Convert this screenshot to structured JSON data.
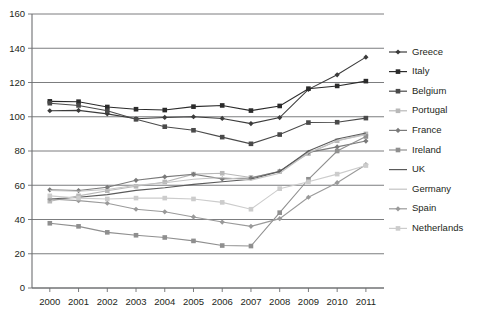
{
  "chart_data": {
    "type": "line",
    "title": "",
    "xlabel": "",
    "ylabel": "",
    "x": [
      2000,
      2001,
      2002,
      2003,
      2004,
      2005,
      2006,
      2007,
      2008,
      2009,
      2010,
      2011
    ],
    "xtick_labels": [
      "2000",
      "2001",
      "2002",
      "2003",
      "2004",
      "2005",
      "2006",
      "2007",
      "2008",
      "2009",
      "2010",
      "2011"
    ],
    "ytick_labels": [
      "0",
      "20",
      "40",
      "60",
      "80",
      "100",
      "120",
      "140",
      "160"
    ],
    "yticks": [
      0,
      20,
      40,
      60,
      80,
      100,
      120,
      140,
      160
    ],
    "ylim": [
      0,
      160
    ],
    "grid": true,
    "legend_position": "right",
    "series": [
      {
        "name": "Greece",
        "marker": "diamond",
        "color": "#3b3b3b",
        "values": [
          103.5,
          103.7,
          101.7,
          97.4,
          98.6,
          100.0,
          106.1,
          107.4,
          112.9,
          129.7,
          148.3,
          170.3
        ],
        "display_values": [
          103.5,
          103.7,
          101.7,
          98.8,
          99.6,
          100.0,
          99.0,
          96.0,
          99.5,
          116.0,
          124.5,
          134.8
        ]
      },
      {
        "name": "Italy",
        "marker": "square",
        "color": "#2b2b2b",
        "values": [
          109.0,
          108.8,
          105.7,
          104.4,
          103.9,
          105.9,
          106.6,
          103.6,
          106.3,
          116.4,
          119.3,
          120.8
        ],
        "display_values": [
          109.0,
          108.8,
          105.7,
          104.4,
          103.9,
          105.9,
          106.6,
          103.6,
          106.3,
          116.4,
          118.0,
          120.8
        ]
      },
      {
        "name": "Belgium",
        "marker": "square",
        "color": "#4a4a4a",
        "values": [
          107.9,
          106.6,
          103.5,
          98.5,
          94.2,
          92.1,
          88.1,
          84.2,
          89.6,
          96.6,
          96.8,
          99.2
        ],
        "display_values": [
          107.9,
          106.6,
          103.5,
          98.5,
          94.2,
          92.1,
          88.1,
          84.2,
          89.6,
          96.6,
          96.8,
          99.2
        ]
      },
      {
        "name": "Portugal",
        "marker": "square",
        "color": "#b8b8b8",
        "values": [
          50.7,
          53.8,
          56.8,
          59.4,
          61.9,
          67.7,
          69.4,
          68.4,
          71.7,
          83.7,
          94.0,
          108.0
        ],
        "display_values": [
          50.7,
          53.8,
          56.8,
          59.4,
          61.9,
          66.5,
          67.0,
          64.5,
          68.0,
          78.5,
          86.0,
          90.0
        ]
      },
      {
        "name": "France",
        "marker": "diamond",
        "color": "#7a7a7a",
        "values": [
          57.3,
          56.9,
          58.8,
          62.9,
          64.9,
          66.4,
          63.7,
          64.2,
          68.2,
          79.2,
          82.4,
          85.8
        ],
        "display_values": [
          57.3,
          56.9,
          58.8,
          62.9,
          64.9,
          66.4,
          63.7,
          64.2,
          68.2,
          79.2,
          82.4,
          85.8
        ]
      },
      {
        "name": "Ireland",
        "marker": "square",
        "color": "#8f8f8f",
        "values": [
          37.0,
          35.2,
          31.9,
          30.7,
          29.4,
          27.2,
          24.5,
          24.8,
          44.2,
          64.4,
          91.2,
          104.1
        ],
        "display_values": [
          37.8,
          36.0,
          32.5,
          30.8,
          29.5,
          27.5,
          24.8,
          24.5,
          44.0,
          63.5,
          80.0,
          88.5
        ]
      },
      {
        "name": "UK",
        "marker": "none",
        "color": "#5a5a5a",
        "values": [
          40.6,
          37.2,
          37.0,
          38.5,
          40.2,
          41.5,
          42.4,
          43.5,
          51.9,
          67.1,
          78.4,
          84.3
        ],
        "display_values": [
          52.0,
          53.0,
          54.5,
          57.0,
          58.5,
          60.5,
          62.0,
          63.5,
          68.0,
          80.0,
          87.0,
          90.5
        ]
      },
      {
        "name": "Germany",
        "marker": "none",
        "color": "#c4c4c4",
        "values": [
          58.9,
          57.7,
          59.4,
          63.1,
          64.8,
          67.0,
          66.5,
          63.7,
          65.2,
          72.6,
          81.0,
          78.4
        ],
        "display_values": [
          57.0,
          56.5,
          57.5,
          60.0,
          61.5,
          63.5,
          64.5,
          63.0,
          67.0,
          79.0,
          86.0,
          89.5
        ]
      },
      {
        "name": "Spain",
        "marker": "diamond",
        "color": "#9a9a9a",
        "values": [
          58.0,
          54.2,
          51.3,
          47.6,
          45.3,
          42.3,
          38.9,
          35.5,
          39.4,
          52.7,
          60.1,
          69.5
        ],
        "display_values": [
          52.0,
          51.0,
          49.5,
          46.0,
          44.5,
          41.5,
          38.5,
          36.0,
          40.5,
          53.0,
          61.5,
          72.0
        ]
      },
      {
        "name": "Netherlands",
        "marker": "square",
        "color": "#cccccc",
        "values": [
          53.8,
          50.7,
          50.5,
          52.0,
          52.4,
          51.8,
          47.4,
          45.3,
          58.5,
          60.8,
          63.4,
          65.7
        ],
        "display_values": [
          53.8,
          52.5,
          52.0,
          52.5,
          52.5,
          52.0,
          50.0,
          46.0,
          58.0,
          62.0,
          66.5,
          71.5
        ]
      }
    ]
  },
  "legend": {
    "items": [
      {
        "label": "Greece"
      },
      {
        "label": "Italy"
      },
      {
        "label": "Belgium"
      },
      {
        "label": "Portugal"
      },
      {
        "label": "France"
      },
      {
        "label": "Ireland"
      },
      {
        "label": "UK"
      },
      {
        "label": "Germany"
      },
      {
        "label": "Spain"
      },
      {
        "label": "Netherlands"
      }
    ]
  }
}
